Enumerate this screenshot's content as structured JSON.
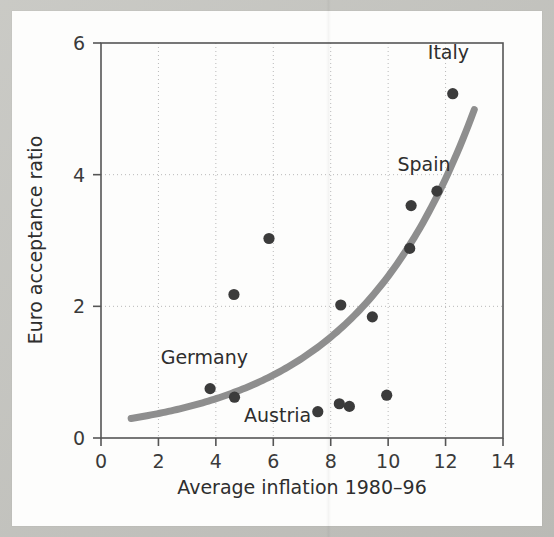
{
  "chart_data": {
    "type": "scatter",
    "title": "",
    "xlabel": "Average inflation 1980–96",
    "ylabel": "Euro acceptance ratio",
    "xlim": [
      0,
      14
    ],
    "ylim": [
      0,
      6
    ],
    "xticks": [
      0,
      2,
      4,
      6,
      8,
      10,
      12,
      14
    ],
    "yticks": [
      0,
      2,
      4,
      6
    ],
    "xtick_labels": [
      "0",
      "2",
      "4",
      "6",
      "8",
      "10",
      "12",
      "14"
    ],
    "ytick_labels": [
      "0",
      "2",
      "4",
      "6"
    ],
    "grid": "dotted-both-axes",
    "legend": "none",
    "marker_color": "#3b3b3b",
    "trendline_color": "#8e8e8e",
    "axis_color": "#555555",
    "grid_color": "#b9b9b9",
    "points": [
      {
        "x": 3.8,
        "y": 0.75,
        "label": "Germany"
      },
      {
        "x": 4.65,
        "y": 0.62,
        "label": "Austria"
      },
      {
        "x": 4.63,
        "y": 2.18,
        "label": ""
      },
      {
        "x": 5.85,
        "y": 3.03,
        "label": ""
      },
      {
        "x": 7.55,
        "y": 0.4,
        "label": ""
      },
      {
        "x": 8.3,
        "y": 0.52,
        "label": ""
      },
      {
        "x": 8.35,
        "y": 2.02,
        "label": ""
      },
      {
        "x": 8.65,
        "y": 0.48,
        "label": ""
      },
      {
        "x": 9.45,
        "y": 1.84,
        "label": ""
      },
      {
        "x": 9.95,
        "y": 0.65,
        "label": ""
      },
      {
        "x": 10.75,
        "y": 2.88,
        "label": ""
      },
      {
        "x": 10.8,
        "y": 3.53,
        "label": ""
      },
      {
        "x": 11.7,
        "y": 3.75,
        "label": "Spain"
      },
      {
        "x": 12.25,
        "y": 5.23,
        "label": "Italy"
      }
    ],
    "annotations": [
      {
        "text": "Italy",
        "x": 12.1,
        "y": 5.75,
        "anchor": "middle"
      },
      {
        "text": "Spain",
        "x": 11.25,
        "y": 4.05,
        "anchor": "middle"
      },
      {
        "text": "Germany",
        "x": 3.6,
        "y": 1.12,
        "anchor": "middle"
      },
      {
        "text": "Austria",
        "x": 6.15,
        "y": 0.24,
        "anchor": "middle"
      }
    ],
    "trendline": {
      "kind": "exponential",
      "description": "fitted exponential curve rising from left to right",
      "x_start": 1.05,
      "x_end": 13.0,
      "y_start": 0.28,
      "y_end": 5.0,
      "a": 0.232,
      "b": 0.236
    }
  }
}
